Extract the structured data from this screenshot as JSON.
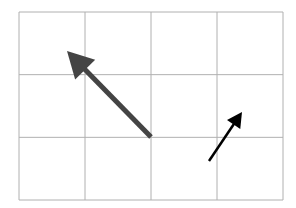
{
  "diagram": {
    "type": "vector-grid",
    "grid": {
      "cols": 4,
      "rows": 3,
      "x0": 19,
      "y0": 12,
      "x1": 283,
      "y1": 200,
      "line_color": "#b0b0b0"
    },
    "vectors": [
      {
        "name": "large-vector",
        "color": "#444444",
        "width": 5,
        "tail": [
          151,
          137
        ],
        "tip": [
          67,
          51
        ],
        "head_len": 26,
        "head_half": 14,
        "grid_displacement": [
          -1.25,
          1.35
        ]
      },
      {
        "name": "small-vector",
        "color": "#000000",
        "width": 2.5,
        "tail": [
          209,
          161
        ],
        "tip": [
          242,
          112
        ],
        "head_len": 15,
        "head_half": 8,
        "grid_displacement": [
          0.5,
          0.8
        ]
      }
    ]
  }
}
